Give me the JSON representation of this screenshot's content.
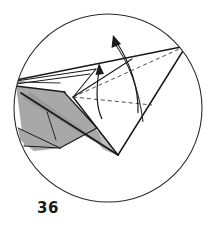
{
  "figure": {
    "caption": "36",
    "kind": "origami-folding-step-diagram",
    "enclosure_shape": "circle"
  },
  "colors": {
    "stroke": "#1a1a1a",
    "thin_stroke": "#3a3a3a",
    "circle_stroke": "#2b2b2b",
    "shade_mid": "#a8a8a8",
    "shade_dark": "#9a9a9a",
    "shade_light": "#bdbdbd",
    "paper_white": "#ffffff",
    "caption_color": "#1a1a1a",
    "background": "#ffffff"
  },
  "geometry": {
    "circle": {
      "cx": 108,
      "cy": 108,
      "r": 94
    },
    "apex_right": {
      "x": 186,
      "y": 46
    },
    "vertex_bottom": {
      "x": 118,
      "y": 155
    },
    "vertex_left_tip": {
      "x": 16,
      "y": 83
    },
    "hub_center": {
      "x": 73,
      "y": 97
    }
  },
  "shapes": {
    "shaded_left_panel": "16,86 64,92 96,127 78,141 60,148 24,146",
    "shaded_left_lower": "18,128 60,148 36,150 22,142",
    "shaded_wedge_band": "30,92 118,155 112,152 22,98",
    "shaded_inner_wedge": "64,92 118,155 104,150 58,100",
    "white_upper_wing": "17,79 90,74 132,59 186,46 96,69 60,83",
    "white_face_right": "73,97 186,46 118,155",
    "white_small_face": "73,97 96,69 132,59 118,100"
  },
  "solid_lines": [
    {
      "name": "top-wing-upper-edge",
      "x1": 16,
      "y1": 80,
      "x2": 186,
      "y2": 46
    },
    {
      "name": "apex-to-bottom-vertex",
      "x1": 186,
      "y1": 46,
      "x2": 118,
      "y2": 155
    },
    {
      "name": "hub-to-bottom-vertex",
      "x1": 73,
      "y1": 97,
      "x2": 118,
      "y2": 155
    },
    {
      "name": "left-tip-to-bottom-vertex",
      "x1": 22,
      "y1": 94,
      "x2": 118,
      "y2": 155
    },
    {
      "name": "left-tip-lower-fold",
      "x1": 16,
      "y1": 86,
      "x2": 64,
      "y2": 92
    },
    {
      "name": "wing-crease-a",
      "x1": 16,
      "y1": 82,
      "x2": 96,
      "y2": 69
    },
    {
      "name": "wing-crease-b",
      "x1": 16,
      "y1": 84,
      "x2": 90,
      "y2": 74
    },
    {
      "name": "wing-vertical-crease",
      "x1": 96,
      "y1": 69,
      "x2": 74,
      "y2": 96
    },
    {
      "name": "hub-to-wing-corner",
      "x1": 73,
      "y1": 97,
      "x2": 132,
      "y2": 59
    },
    {
      "name": "panel-right-edge",
      "x1": 64,
      "y1": 92,
      "x2": 97,
      "y2": 128
    },
    {
      "name": "panel-lower-edge",
      "x1": 97,
      "y1": 128,
      "x2": 60,
      "y2": 148
    },
    {
      "name": "panel-lower-left-edge",
      "x1": 60,
      "y1": 148,
      "x2": 24,
      "y2": 146
    },
    {
      "name": "panel-inner-crease",
      "x1": 18,
      "y1": 128,
      "x2": 60,
      "y2": 148
    },
    {
      "name": "panel-short-crease",
      "x1": 47,
      "y1": 112,
      "x2": 56,
      "y2": 140
    }
  ],
  "dashed_lines": [
    {
      "name": "hub-to-apex-hidden-edge",
      "x1": 73,
      "y1": 97,
      "x2": 186,
      "y2": 46
    },
    {
      "name": "hub-to-right-hidden-edge",
      "x1": 73,
      "y1": 97,
      "x2": 150,
      "y2": 104
    },
    {
      "name": "hub-to-lower-hidden-edge",
      "x1": 74,
      "y1": 98,
      "x2": 112,
      "y2": 148
    }
  ],
  "arrows": [
    {
      "name": "short-fold-arrow",
      "path": "M 102,118 C 96,106 96,90 99,70",
      "head": "99,64 95,75 104,75",
      "direction": "up"
    },
    {
      "name": "long-rotation-arrow",
      "path": "M 138,112 C 138,86 128,60 116,42",
      "head": "114,36 111,48 121,45",
      "direction": "up-left"
    }
  ],
  "arcs": [
    {
      "name": "rotation-guide-arc",
      "path": "M 142,120 C 138,86 126,58 112,40"
    }
  ]
}
